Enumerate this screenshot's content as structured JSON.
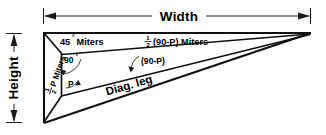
{
  "diagram": {
    "background_color": "#ffffff",
    "line_color": "#111111",
    "dimensions": {
      "width_label": "Width",
      "height_label": "Height"
    },
    "labels": {
      "miter_45": "45",
      "miter_45_degree_symbol": "°",
      "miter_45_suffix": "Miters",
      "miter_half_p_numerator": "1",
      "miter_half_p_denominator": "2",
      "miter_half_p_suffix": "P Miters",
      "miter_half_90p_numerator": "1",
      "miter_half_90p_denominator": "2",
      "miter_half_90p_suffix": "(90-P) Miters",
      "angle_90": "90",
      "angle_90_degree_symbol": "°",
      "angle_p": "P",
      "angle_90_minus_p": "(90-P)",
      "diagonal_leg": "Diag. leg"
    }
  }
}
